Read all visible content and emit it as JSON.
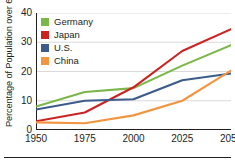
{
  "chart_data": {
    "type": "line",
    "title": "",
    "xlabel": "",
    "ylabel": "Percentage of Population over 65",
    "x": [
      1950,
      1975,
      2000,
      2025,
      2050
    ],
    "xlim": [
      1950,
      2050
    ],
    "ylim": [
      0,
      40
    ],
    "xticks": [
      "1950",
      "1975",
      "2000",
      "2025",
      "2050"
    ],
    "yticks": [
      "0",
      "10",
      "20",
      "30",
      "40"
    ],
    "ytick_values": [
      0,
      10,
      20,
      30,
      40
    ],
    "grid": "horizontal",
    "legend_position": "top-left",
    "series": [
      {
        "name": "Germany",
        "color": "#7AB648",
        "values": [
          8.0,
          13.0,
          14.3,
          22.0,
          29.0
        ]
      },
      {
        "name": "Japan",
        "color": "#CC2222",
        "values": [
          3.0,
          6.0,
          14.6,
          27.0,
          34.5
        ]
      },
      {
        "name": "U.S.",
        "color": "#3C5B8C",
        "values": [
          7.0,
          10.0,
          10.5,
          17.0,
          19.3
        ]
      },
      {
        "name": "China",
        "color": "#F29541",
        "values": [
          2.6,
          2.3,
          5.0,
          10.0,
          20.3
        ]
      }
    ]
  },
  "axis": {
    "y_title": "Percentage of Population over 65"
  },
  "legend": {
    "items": [
      {
        "label": "Germany",
        "color": "#7AB648",
        "swatch": "legend-swatch-germany"
      },
      {
        "label": "Japan",
        "color": "#CC2222",
        "swatch": "legend-swatch-japan"
      },
      {
        "label": "U.S.",
        "color": "#3C5B8C",
        "swatch": "legend-swatch-us"
      },
      {
        "label": "China",
        "color": "#F29541",
        "swatch": "legend-swatch-china"
      }
    ]
  },
  "colors": {
    "axis": "#231f20",
    "grid": "#d9d9d9",
    "background": "#ffffff"
  }
}
